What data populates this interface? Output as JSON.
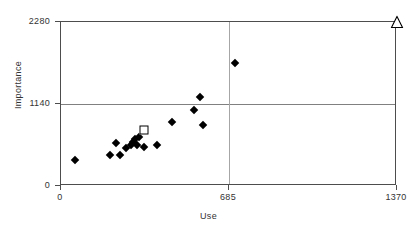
{
  "chart_data": {
    "type": "scatter",
    "title": "",
    "xlabel": "Use",
    "ylabel": "Importance",
    "xlim": [
      0,
      1370
    ],
    "ylim": [
      0,
      2280
    ],
    "xticks": [
      0,
      685,
      1370
    ],
    "xtick_labels": [
      "0",
      "685",
      "1370"
    ],
    "yticks": [
      0,
      1140,
      2280
    ],
    "ytick_labels": [
      "0",
      "1140",
      "2280"
    ],
    "grid": "major gridlines at x=685 and y=1140",
    "legend": "none",
    "series": [
      {
        "name": "data points",
        "marker": "filled-diamond",
        "color": "#000000",
        "points": [
          [
            57,
            367
          ],
          [
            200,
            426
          ],
          [
            224,
            597
          ],
          [
            241,
            426
          ],
          [
            265,
            525
          ],
          [
            286,
            568
          ],
          [
            294,
            610
          ],
          [
            302,
            653
          ],
          [
            310,
            568
          ],
          [
            318,
            682
          ],
          [
            339,
            540
          ],
          [
            392,
            568
          ],
          [
            453,
            896
          ],
          [
            543,
            1055
          ],
          [
            567,
            1240
          ],
          [
            580,
            852
          ],
          [
            710,
            1710
          ]
        ]
      },
      {
        "name": "highlighted point",
        "marker": "open-square",
        "color": "#000000",
        "points": [
          [
            339,
            781
          ]
        ]
      },
      {
        "name": "off-scale marker",
        "marker": "open-triangle",
        "color": "#000000",
        "points": [
          [
            1370,
            2280
          ]
        ]
      }
    ]
  },
  "axes": {
    "y_title": "Importance",
    "x_title": "Use",
    "y_tick_labels": [
      "2280",
      "1140",
      "0"
    ],
    "x_tick_labels": [
      "0",
      "685",
      "1370"
    ]
  }
}
